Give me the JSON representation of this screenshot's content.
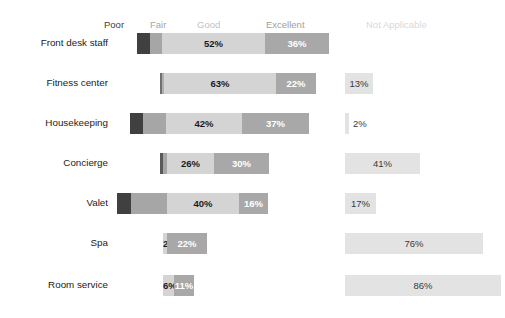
{
  "legend": {
    "items": [
      {
        "label": "Poor",
        "color": "#404040",
        "x": 104
      },
      {
        "label": "Fair",
        "color": "#a6a6a6",
        "x": 150
      },
      {
        "label": "Good",
        "color": "#bfbfbf",
        "x": 197
      },
      {
        "label": "Excellent",
        "color": "#a0a0a0",
        "x": 266
      },
      {
        "label": "Not Applicable",
        "color": "#d9d9d9",
        "x": 366
      }
    ]
  },
  "colors": {
    "poor": "#404040",
    "fair": "#a6a6a6",
    "good": "#d4d4d4",
    "excellent": "#a8a8a8",
    "not_applicable": "#e3e3e3",
    "label_dark": "#1b1b1b",
    "label_light": "#ffffff"
  },
  "chart_data": {
    "type": "bar",
    "subtype": "diverging-stacked-bar",
    "title": "",
    "xlabel": "",
    "ylabel": "",
    "categories": [
      "Front desk staff",
      "Fitness center",
      "Housekeeping",
      "Concierge",
      "Valet",
      "Spa",
      "Room service"
    ],
    "series": [
      {
        "name": "Poor",
        "values": [
          5,
          1,
          6,
          1,
          7,
          0,
          0
        ]
      },
      {
        "name": "Fair",
        "values": [
          6,
          1,
          13,
          2,
          20,
          0,
          0
        ]
      },
      {
        "name": "Good",
        "values": [
          52,
          63,
          42,
          26,
          40,
          2,
          6
        ]
      },
      {
        "name": "Excellent",
        "values": [
          36,
          22,
          37,
          30,
          16,
          22,
          11
        ]
      },
      {
        "name": "Not Applicable",
        "values": [
          0,
          13,
          2,
          41,
          17,
          76,
          86
        ]
      }
    ],
    "legend_position": "top",
    "grid": false
  },
  "rows": [
    {
      "label": "Front desk staff",
      "y": 28,
      "segments": [
        {
          "name": "poor",
          "x": 137,
          "w": 13,
          "label": "",
          "color": "#404040",
          "text": "#ffffff"
        },
        {
          "name": "fair",
          "x": 150,
          "w": 12,
          "label": "",
          "color": "#a6a6a6",
          "text": "#ffffff"
        },
        {
          "name": "good",
          "x": 162,
          "w": 103,
          "label": "52%",
          "color": "#d4d4d4",
          "text": "#1b1b1b"
        },
        {
          "name": "excellent",
          "x": 265,
          "w": 64,
          "label": "36%",
          "color": "#a8a8a8",
          "text": "#ffffff"
        }
      ],
      "na": null
    },
    {
      "label": "Fitness center",
      "y": 68,
      "segments": [
        {
          "name": "poor",
          "x": 160,
          "w": 2,
          "label": "",
          "color": "#707070",
          "text": "#ffffff"
        },
        {
          "name": "fair",
          "x": 162,
          "w": 2,
          "label": "",
          "color": "#b0b0b0",
          "text": "#ffffff"
        },
        {
          "name": "good",
          "x": 164,
          "w": 112,
          "label": "63%",
          "color": "#d4d4d4",
          "text": "#1b1b1b"
        },
        {
          "name": "excellent",
          "x": 276,
          "w": 40,
          "label": "22%",
          "color": "#a8a8a8",
          "text": "#ffffff"
        }
      ],
      "na": {
        "x": 345,
        "w": 28,
        "label": "13%",
        "outside": false
      }
    },
    {
      "label": "Housekeeping",
      "y": 108,
      "segments": [
        {
          "name": "poor",
          "x": 130,
          "w": 13,
          "label": "",
          "color": "#404040",
          "text": "#ffffff"
        },
        {
          "name": "fair",
          "x": 143,
          "w": 23,
          "label": "",
          "color": "#a6a6a6",
          "text": "#ffffff"
        },
        {
          "name": "good",
          "x": 166,
          "w": 76,
          "label": "42%",
          "color": "#d4d4d4",
          "text": "#1b1b1b"
        },
        {
          "name": "excellent",
          "x": 242,
          "w": 67,
          "label": "37%",
          "color": "#a8a8a8",
          "text": "#ffffff"
        }
      ],
      "na": {
        "x": 345,
        "w": 4,
        "label": "2%",
        "outside": true
      }
    },
    {
      "label": "Concierge",
      "y": 148,
      "segments": [
        {
          "name": "poor",
          "x": 160,
          "w": 3,
          "label": "",
          "color": "#5a5a5a",
          "text": "#ffffff"
        },
        {
          "name": "fair",
          "x": 163,
          "w": 4,
          "label": "",
          "color": "#a6a6a6",
          "text": "#ffffff"
        },
        {
          "name": "good",
          "x": 167,
          "w": 47,
          "label": "26%",
          "color": "#d4d4d4",
          "text": "#1b1b1b"
        },
        {
          "name": "excellent",
          "x": 214,
          "w": 55,
          "label": "30%",
          "color": "#a8a8a8",
          "text": "#ffffff"
        }
      ],
      "na": {
        "x": 345,
        "w": 75,
        "label": "41%",
        "outside": false
      }
    },
    {
      "label": "Valet",
      "y": 188,
      "segments": [
        {
          "name": "poor",
          "x": 117,
          "w": 14,
          "label": "",
          "color": "#404040",
          "text": "#ffffff"
        },
        {
          "name": "fair",
          "x": 131,
          "w": 36,
          "label": "",
          "color": "#a6a6a6",
          "text": "#ffffff"
        },
        {
          "name": "good",
          "x": 167,
          "w": 72,
          "label": "40%",
          "color": "#d4d4d4",
          "text": "#1b1b1b"
        },
        {
          "name": "excellent",
          "x": 239,
          "w": 29,
          "label": "16%",
          "color": "#a8a8a8",
          "text": "#ffffff"
        }
      ],
      "na": {
        "x": 345,
        "w": 31,
        "label": "17%",
        "outside": false
      }
    },
    {
      "label": "Spa",
      "y": 228,
      "segments": [
        {
          "name": "good",
          "x": 163,
          "w": 4,
          "label": "2%",
          "color": "#d4d4d4",
          "text": "#1b1b1b"
        },
        {
          "name": "excellent",
          "x": 167,
          "w": 40,
          "label": "22%",
          "color": "#a8a8a8",
          "text": "#ffffff"
        }
      ],
      "na": {
        "x": 345,
        "w": 138,
        "label": "76%",
        "outside": false
      }
    },
    {
      "label": "Room service",
      "y": 270,
      "segments": [
        {
          "name": "good",
          "x": 163,
          "w": 11,
          "label": "6%",
          "color": "#d4d4d4",
          "text": "#1b1b1b"
        },
        {
          "name": "excellent",
          "x": 174,
          "w": 20,
          "label": "11%",
          "color": "#a8a8a8",
          "text": "#ffffff"
        }
      ],
      "na": {
        "x": 345,
        "w": 156,
        "label": "86%",
        "outside": false
      }
    }
  ]
}
